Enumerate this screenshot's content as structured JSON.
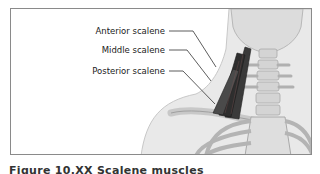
{
  "figure": {
    "labels": [
      {
        "id": "anterior",
        "text": "Anterior scalene"
      },
      {
        "id": "middle",
        "text": "Middle scalene"
      },
      {
        "id": "posterior",
        "text": "Posterior scalene"
      }
    ],
    "caption": "Figure 10.XX  Scalene muscles",
    "colors": {
      "skin": "#e8e8e8",
      "bone": "#cfcfcf",
      "muscle": "#3a3a3a",
      "leader": "#333333",
      "frame": "#8a8a8a"
    }
  }
}
